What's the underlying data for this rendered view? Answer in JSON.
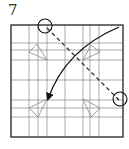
{
  "step": {
    "number": "7"
  },
  "diagram": {
    "square": {
      "x1": 11,
      "y1": 25,
      "x2": 123,
      "y2": 137
    },
    "vertical_lines": [
      29,
      38,
      47,
      65,
      83,
      90,
      99
    ],
    "horizontal_lines": [
      43,
      50,
      60,
      80,
      100,
      108,
      117
    ],
    "triangles": [
      {
        "points": "29,52 37,44 47,60"
      },
      {
        "points": "83,60 91,45 100,52"
      },
      {
        "points": "29,108 47,99 38,117"
      },
      {
        "points": "83,99 100,108 91,117"
      }
    ],
    "fold_line": {
      "x1": 47,
      "y1": 28,
      "x2": 119,
      "y2": 100
    },
    "circles": [
      {
        "cx": 45,
        "cy": 26,
        "r": 7
      },
      {
        "cx": 120,
        "cy": 99,
        "r": 7
      }
    ],
    "arrow": {
      "path": "M 119 27 Q 65 50 48 99"
    },
    "colors": {
      "frame": "#222222",
      "grid": "#888888",
      "triangle": "#888888",
      "arrow": "#111111"
    }
  }
}
